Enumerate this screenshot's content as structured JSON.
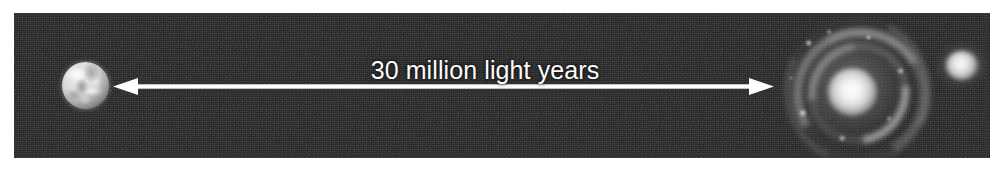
{
  "figure": {
    "type": "astronomy-scale-diagram",
    "caption_text": "30 million light years",
    "background_color": "#ffffff",
    "panel_color": "#2a2a2a",
    "annotation_color": "#ffffff"
  },
  "annotation": {
    "distance_label": "30 million light years",
    "distance_value": "30",
    "distance_unit": "million light years",
    "arrow_style": "double-headed"
  },
  "objects": {
    "left": {
      "name": "Earth",
      "icon": "earth-globe-icon"
    },
    "right_primary": {
      "name": "Whirlpool Galaxy",
      "icon": "spiral-galaxy-icon"
    },
    "right_companion": {
      "name": "Companion Galaxy",
      "icon": "elliptical-galaxy-icon"
    }
  }
}
